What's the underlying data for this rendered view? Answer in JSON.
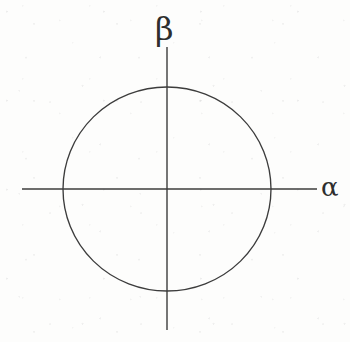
{
  "figure": {
    "kind": "math-diagram",
    "background_color": "#fdfdfc",
    "ink_color": "#3c3c3c"
  },
  "axes": {
    "horizontal": {
      "name": "alpha-axis",
      "label": "α",
      "label_position": "right-end",
      "y": 189,
      "x_start": 22,
      "x_end": 317
    },
    "vertical": {
      "name": "beta-axis",
      "label": "β",
      "label_position": "top-end",
      "x": 167,
      "y_start": 47,
      "y_end": 330
    },
    "origin": {
      "x": 167,
      "y": 189
    }
  },
  "chart_data": {
    "type": "scatter",
    "title": "",
    "subtitle": "",
    "xlabel": "α",
    "ylabel": "β",
    "grid": false,
    "legend": null,
    "xlim": [
      -1.4,
      1.45
    ],
    "ylim": [
      -1.38,
      1.38
    ],
    "series": [
      {
        "name": "circle",
        "shape": "circle",
        "center": [
          0,
          0
        ],
        "radius": 1,
        "fill": "none",
        "stroke": "#3c3c3c"
      }
    ],
    "annotations": [
      {
        "text": "α",
        "at": [
          1.5,
          0
        ],
        "role": "axis-label"
      },
      {
        "text": "β",
        "at": [
          0,
          1.5
        ],
        "role": "axis-label"
      }
    ]
  },
  "geometry": {
    "circle": {
      "center_x": 167,
      "center_y": 189,
      "radius_x": 104,
      "radius_y": 102
    }
  }
}
